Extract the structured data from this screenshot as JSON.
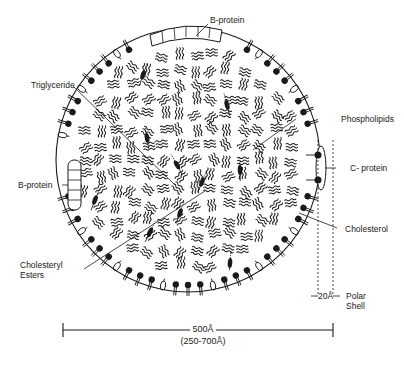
{
  "diagram": {
    "colors": {
      "ink": "#1a1a1a",
      "background": "#ffffff"
    },
    "labels": {
      "b_protein_top": "B-protein",
      "triglyceride": "Triglyceride",
      "phospholipids": "Phospholipids",
      "c_protein": "C- protein",
      "b_protein_left": "B-protein",
      "cholesterol": "Cholesterol",
      "cholesteryl_esters_1": "Cholesteryl",
      "cholesteryl_esters_2": "Esters",
      "shell_width": "20Å",
      "polar_shell_1": "Polar",
      "polar_shell_2": "Shell"
    },
    "scale": {
      "diameter": "500Å",
      "range": "(250-700Å)"
    }
  }
}
